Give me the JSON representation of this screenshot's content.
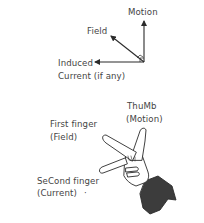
{
  "vector_diagram": {
    "motion_label": "Motion",
    "field_label": "Field",
    "induced_label_line1": "Induced",
    "induced_label_line2": "Current (if any)"
  },
  "hand_diagram": {
    "thumb_label_line1": "ThuMb",
    "thumb_label_line2": "(Motion)",
    "first_finger_line1": "First finger",
    "first_finger_line2": "(Field)",
    "second_finger_line1": "SeCond finger",
    "second_finger_line2": "(Current)",
    "stray_mark": "·"
  },
  "colors": {
    "line": "#2b2b2b",
    "text": "#444444",
    "sleeve": "#3c3c3c",
    "background": "#ffffff"
  }
}
